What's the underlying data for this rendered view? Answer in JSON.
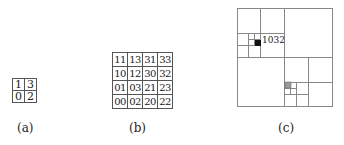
{
  "figure": {
    "panel_a": {
      "caption": "(a)",
      "grid": [
        [
          "1",
          "3"
        ],
        [
          "0",
          "2"
        ]
      ]
    },
    "panel_b": {
      "caption": "(b)",
      "grid": [
        [
          "11",
          "13",
          "31",
          "33"
        ],
        [
          "10",
          "12",
          "30",
          "32"
        ],
        [
          "01",
          "03",
          "21",
          "23"
        ],
        [
          "00",
          "02",
          "20",
          "22"
        ]
      ]
    },
    "panel_c": {
      "caption": "(c)",
      "highlighted_cell_label": "1032",
      "colors": {
        "black_cell": "#111111",
        "gray_cell": "#999999",
        "lines": "#777777"
      }
    }
  }
}
